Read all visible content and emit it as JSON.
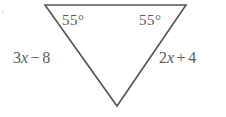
{
  "figure": {
    "type": "geometry-diagram",
    "shape": "triangle",
    "orientation": "inverted",
    "background_color": "#ffffff",
    "stroke_color": "#555555",
    "text_color": "#5a5a5a",
    "stroke_width": 1.6,
    "vertices": {
      "top_left": {
        "x": 45,
        "y": 5
      },
      "top_right": {
        "x": 186,
        "y": 5
      },
      "bottom": {
        "x": 117,
        "y": 106
      }
    },
    "angles": [
      {
        "position": "top-left",
        "value": "55",
        "unit": "°",
        "text": "55°"
      },
      {
        "position": "top-right",
        "value": "55",
        "unit": "°",
        "text": "55°"
      }
    ],
    "sides": [
      {
        "position": "left",
        "text": "3x − 8",
        "coefficient": "3",
        "variable": "x",
        "operator": "−",
        "constant": "8"
      },
      {
        "position": "right",
        "text": "2x + 4",
        "coefficient": "2",
        "variable": "x",
        "operator": "+",
        "constant": "4"
      }
    ]
  }
}
